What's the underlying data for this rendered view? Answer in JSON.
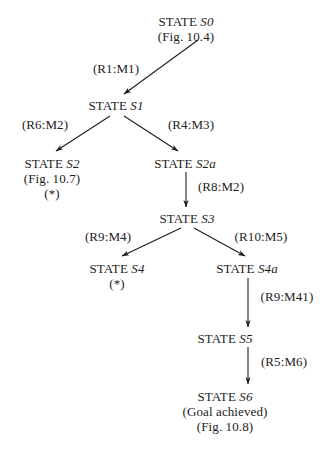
{
  "diagram": {
    "type": "tree",
    "background_color": "#ffffff",
    "text_color": "#1d1d1d",
    "nodes": [
      {
        "id": "S0",
        "lines": [
          "STATE S0",
          "(Fig. 10.4)"
        ],
        "state_label": "STATE",
        "state_symbol": "S0",
        "note": "(Fig. 10.4)",
        "x": 186,
        "y": 14
      },
      {
        "id": "S1",
        "lines": [
          "STATE S1"
        ],
        "state_label": "STATE",
        "state_symbol": "S1",
        "note": "",
        "x": 116,
        "y": 98
      },
      {
        "id": "S2",
        "lines": [
          "STATE S2",
          "(Fig. 10.7)",
          "(*)"
        ],
        "state_label": "STATE",
        "state_symbol": "S2",
        "note": "(Fig. 10.7)",
        "marker": "(*)",
        "x": 52,
        "y": 156
      },
      {
        "id": "S2a",
        "lines": [
          "STATE S2a"
        ],
        "state_label": "STATE",
        "state_symbol": "S2a",
        "note": "",
        "x": 185,
        "y": 156
      },
      {
        "id": "S3",
        "lines": [
          "STATE S3"
        ],
        "state_label": "STATE",
        "state_symbol": "S3",
        "note": "",
        "x": 187,
        "y": 211
      },
      {
        "id": "S4",
        "lines": [
          "STATE S4",
          "(*)"
        ],
        "state_label": "STATE",
        "state_symbol": "S4",
        "marker": "(*)",
        "x": 117,
        "y": 261
      },
      {
        "id": "S4a",
        "lines": [
          "STATE S4a"
        ],
        "state_label": "STATE",
        "state_symbol": "S4a",
        "note": "",
        "x": 247,
        "y": 261
      },
      {
        "id": "S5",
        "lines": [
          "STATE S5"
        ],
        "state_label": "STATE",
        "state_symbol": "S5",
        "note": "",
        "x": 225,
        "y": 331
      },
      {
        "id": "S6",
        "lines": [
          "STATE S6",
          "(Goal achieved)",
          "(Fig. 10.8)"
        ],
        "state_label": "STATE",
        "state_symbol": "S6",
        "note": "(Goal achieved)",
        "note2": "(Fig. 10.8)",
        "x": 225,
        "y": 389
      }
    ],
    "edges": [
      {
        "id": "e1",
        "from": "S0",
        "to": "S1",
        "label": "(R1:M1)",
        "label_x": 116,
        "label_y": 61
      },
      {
        "id": "e2",
        "from": "S1",
        "to": "S2",
        "label": "(R6:M2)",
        "label_x": 45,
        "label_y": 117
      },
      {
        "id": "e3",
        "from": "S1",
        "to": "S2a",
        "label": "(R4:M3)",
        "label_x": 191,
        "label_y": 117
      },
      {
        "id": "e4",
        "from": "S2a",
        "to": "S3",
        "label": "(R8:M2)",
        "label_x": 221,
        "label_y": 179
      },
      {
        "id": "e5",
        "from": "S3",
        "to": "S4",
        "label": "(R9:M4)",
        "label_x": 108,
        "label_y": 229
      },
      {
        "id": "e6",
        "from": "S3",
        "to": "S4a",
        "label": "(R10:M5)",
        "label_x": 261,
        "label_y": 229
      },
      {
        "id": "e7",
        "from": "S4a",
        "to": "S5",
        "label": "(R9:M41)",
        "label_x": 287,
        "label_y": 289
      },
      {
        "id": "e8",
        "from": "S5",
        "to": "S6",
        "label": "(R5:M6)",
        "label_x": 284,
        "label_y": 354
      }
    ]
  }
}
